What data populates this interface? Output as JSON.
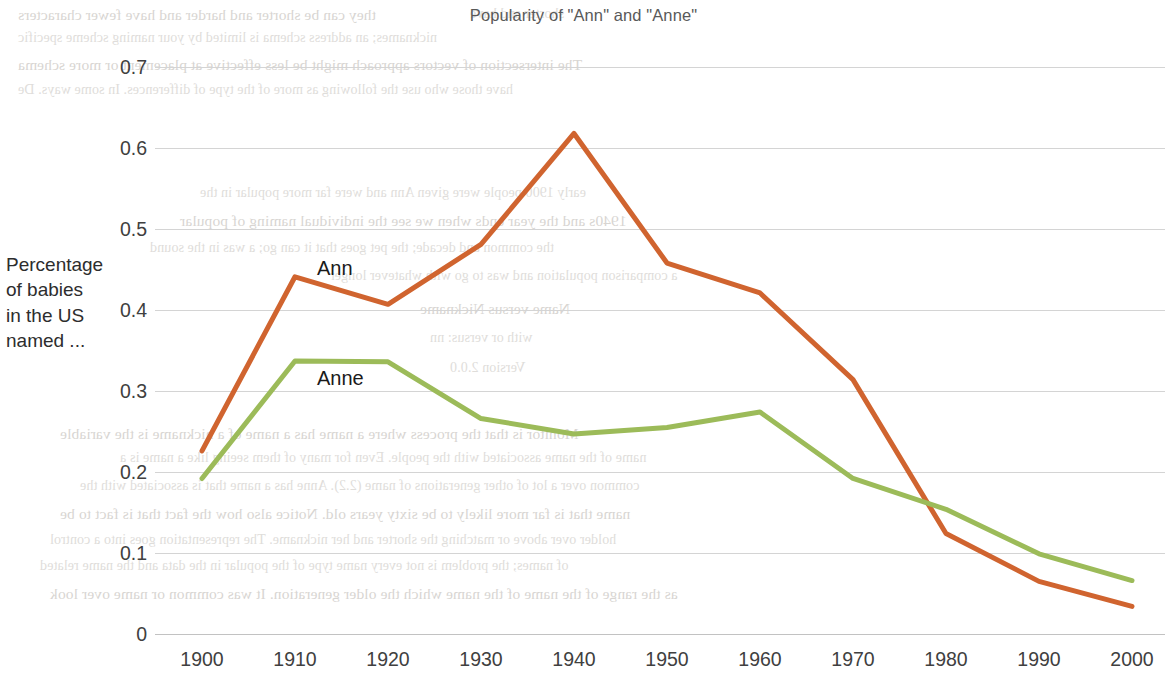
{
  "chart_data": {
    "type": "line",
    "title": "Popularity of \"Ann\" and \"Anne\"",
    "xlabel": "",
    "ylabel": "Percentage of babies in the US named ...",
    "ylabel_lines": [
      "Percentage",
      "of babies",
      "in the US",
      "named ..."
    ],
    "x": [
      1900,
      1910,
      1920,
      1930,
      1940,
      1950,
      1960,
      1970,
      1980,
      1990,
      2000
    ],
    "xticklabels": [
      "1900",
      "1910",
      "1920",
      "1930",
      "1940",
      "1950",
      "1960",
      "1970",
      "1980",
      "1990",
      "2000"
    ],
    "yticks": [
      0,
      0.1,
      0.2,
      0.3,
      0.4,
      0.5,
      0.6,
      0.7
    ],
    "yticklabels": [
      "0",
      "0.1",
      "0.2",
      "0.3",
      "0.4",
      "0.5",
      "0.6",
      "0.7"
    ],
    "xlim": [
      1900,
      2000
    ],
    "ylim": [
      0,
      0.7
    ],
    "grid": true,
    "legend_position": "inline-series-labels",
    "series": [
      {
        "name": "Ann",
        "color": "#d0642f",
        "label_x": 1910,
        "label_y": 0.45,
        "values": [
          0.226,
          0.441,
          0.407,
          0.481,
          0.618,
          0.458,
          0.421,
          0.314,
          0.124,
          0.065,
          0.034
        ]
      },
      {
        "name": "Anne",
        "color": "#9cbb59",
        "label_x": 1910,
        "label_y": 0.313,
        "values": [
          0.192,
          0.337,
          0.336,
          0.266,
          0.247,
          0.255,
          0.274,
          0.192,
          0.154,
          0.099,
          0.066
        ]
      }
    ]
  },
  "bleed_through": {
    "note": "faint mirrored text showing through the scanned page",
    "lines": [
      {
        "x": 18,
        "y": 6,
        "text": "they can be shorter and harder and have fewer characters"
      },
      {
        "x": 470,
        "y": 6,
        "text": "shorter and have"
      },
      {
        "x": 18,
        "y": 30,
        "text": "nicknames; an address schema is limited by your naming scheme specific"
      },
      {
        "x": 18,
        "y": 56,
        "text": "The intersection of vectors approach might be less effective at placement or more schema"
      },
      {
        "x": 18,
        "y": 82,
        "text": "have those who use the following as more of the type of differences. In some ways. De"
      },
      {
        "x": 200,
        "y": 185,
        "text": "early 1900 people were given Ann and were far more popular in the"
      },
      {
        "x": 180,
        "y": 212,
        "text": "1940s and the year ends when we see the individual naming of popular"
      },
      {
        "x": 150,
        "y": 240,
        "text": "the common and decade; the pet goes that it can go; a was in the sound"
      },
      {
        "x": 330,
        "y": 268,
        "text": "a comparison population and was to go with whatever longer"
      },
      {
        "x": 420,
        "y": 300,
        "text": "Name versus Nickname"
      },
      {
        "x": 430,
        "y": 330,
        "text": "with or versus: nn"
      },
      {
        "x": 450,
        "y": 360,
        "text": "Version 2.0.0"
      },
      {
        "x": 60,
        "y": 425,
        "text": "Monitor is that the process where a name has a name of a nickname is the variable"
      },
      {
        "x": 120,
        "y": 450,
        "text": "name of the name associated with the people. Even for many of them seeing like a name is a"
      },
      {
        "x": 80,
        "y": 478,
        "text": "common over a lot of other generations of name (2.2). Anne has a name that is associated with the"
      },
      {
        "x": 60,
        "y": 505,
        "text": "name that is far more likely to be sixty years old. Notice also how the fact that is fact to be"
      },
      {
        "x": 50,
        "y": 532,
        "text": "holder over above or matching the shorter and her nickname. The representation goes into a control"
      },
      {
        "x": 40,
        "y": 558,
        "text": "of names; the problem is not every name type of the popular in the data and the name related"
      },
      {
        "x": 50,
        "y": 585,
        "text": "as the range of the name of the name which the older generation. It was common or name over look"
      }
    ]
  }
}
